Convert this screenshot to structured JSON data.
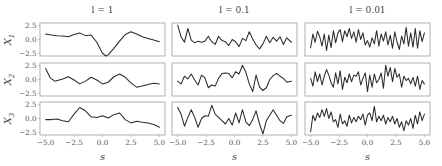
{
  "chart_data": {
    "type": "line",
    "title": "",
    "layout": {
      "rows": 3,
      "cols": 3,
      "grid": false,
      "legend": "none"
    },
    "column_titles": [
      "l = 1",
      "l = 0.1",
      "l = 0.01"
    ],
    "row_labels": [
      "X_1",
      "X_2",
      "X_3"
    ],
    "xlabel": "s",
    "xlim": [
      -5.0,
      5.0
    ],
    "ylim": [
      -3.0,
      3.0
    ],
    "xticks": [
      -5.0,
      -2.5,
      0.0,
      2.5,
      5.0
    ],
    "xtick_labels": [
      "−5.0",
      "−2.5",
      "0.0",
      "2.5",
      "5.0"
    ],
    "yticks": [
      2.5,
      0.0,
      -2.5
    ],
    "ytick_labels": [
      "2.5",
      "0.0",
      "−2.5"
    ],
    "panels": [
      {
        "row": 0,
        "col": 0,
        "name": "X1, l=1",
        "x": [
          -5.0,
          -4.5,
          -4.0,
          -3.5,
          -3.0,
          -2.5,
          -2.0,
          -1.5,
          -1.0,
          -0.5,
          0.0,
          0.3,
          0.5,
          1.0,
          1.5,
          2.0,
          2.5,
          3.0,
          3.5,
          4.0,
          4.5,
          5.0
        ],
        "y": [
          1.0,
          0.8,
          0.7,
          0.65,
          0.5,
          0.9,
          1.2,
          0.7,
          0.8,
          -0.5,
          -2.5,
          -3.0,
          -2.8,
          -1.6,
          -0.3,
          0.9,
          1.4,
          1.0,
          0.5,
          0.2,
          -0.1,
          -0.4
        ]
      },
      {
        "row": 1,
        "col": 0,
        "name": "X2, l=1",
        "x": [
          -5.0,
          -4.6,
          -4.2,
          -3.5,
          -3.0,
          -2.5,
          -2.0,
          -1.5,
          -1.0,
          -0.5,
          0.0,
          0.5,
          1.0,
          1.5,
          2.0,
          2.5,
          3.0,
          3.5,
          4.0,
          4.5,
          5.0
        ],
        "y": [
          2.0,
          0.3,
          -0.3,
          0.1,
          0.5,
          -0.1,
          -0.8,
          -0.3,
          0.4,
          -0.1,
          -0.8,
          -0.5,
          0.5,
          1.0,
          0.4,
          -0.6,
          -1.4,
          -1.2,
          -0.9,
          -0.7,
          -0.8
        ]
      },
      {
        "row": 2,
        "col": 0,
        "name": "X3, l=1",
        "x": [
          -5.0,
          -4.5,
          -4.0,
          -3.5,
          -3.0,
          -2.5,
          -2.0,
          -1.5,
          -1.0,
          -0.5,
          0.0,
          0.5,
          1.0,
          1.5,
          2.0,
          2.5,
          3.0,
          3.5,
          4.0,
          4.5,
          5.0
        ],
        "y": [
          -0.2,
          -0.2,
          -0.1,
          -0.4,
          -0.6,
          0.8,
          2.0,
          1.4,
          0.3,
          0.2,
          0.5,
          0.1,
          0.7,
          1.0,
          -0.2,
          -0.8,
          -0.5,
          -0.7,
          -0.8,
          -1.1,
          -1.6
        ]
      },
      {
        "row": 0,
        "col": 1,
        "name": "X1, l=0.1",
        "x": [
          -5.0,
          -4.7,
          -4.4,
          -4.1,
          -3.8,
          -3.5,
          -3.2,
          -2.9,
          -2.6,
          -2.3,
          -2.0,
          -1.7,
          -1.4,
          -1.1,
          -0.8,
          -0.5,
          -0.2,
          0.1,
          0.4,
          0.7,
          1.0,
          1.3,
          1.6,
          1.9,
          2.2,
          2.5,
          2.8,
          3.1,
          3.4,
          3.7,
          4.0,
          4.3,
          4.6,
          5.0
        ],
        "y": [
          2.6,
          0.5,
          -0.5,
          2.0,
          -0.1,
          -0.6,
          -0.3,
          -0.5,
          -0.3,
          0.6,
          -0.4,
          -0.9,
          0.6,
          -0.2,
          -0.4,
          -1.1,
          0.0,
          -0.4,
          -1.3,
          0.2,
          -0.2,
          1.4,
          0.1,
          -1.0,
          -1.7,
          -0.8,
          0.6,
          -0.6,
          0.4,
          -0.3,
          0.5,
          -0.9,
          0.3,
          -0.5
        ]
      },
      {
        "row": 1,
        "col": 1,
        "name": "X2, l=0.1",
        "x": [
          -5.0,
          -4.7,
          -4.4,
          -4.1,
          -3.8,
          -3.5,
          -3.2,
          -2.9,
          -2.6,
          -2.3,
          -2.0,
          -1.7,
          -1.4,
          -1.1,
          -0.8,
          -0.5,
          -0.2,
          0.1,
          0.4,
          0.7,
          1.0,
          1.3,
          1.6,
          1.9,
          2.2,
          2.5,
          2.8,
          3.1,
          3.4,
          3.7,
          4.0,
          4.3,
          4.6,
          5.0
        ],
        "y": [
          -0.3,
          -0.8,
          0.6,
          0.1,
          1.0,
          -0.1,
          -1.0,
          0.8,
          0.3,
          -1.5,
          -1.0,
          -1.2,
          0.2,
          1.1,
          1.2,
          1.1,
          0.3,
          1.4,
          1.0,
          2.6,
          1.3,
          -0.8,
          -2.2,
          0.8,
          -1.4,
          -2.0,
          -1.5,
          0.0,
          0.7,
          1.1,
          0.6,
          0.2,
          -0.5,
          -0.3
        ]
      },
      {
        "row": 2,
        "col": 1,
        "name": "X3, l=0.1",
        "x": [
          -5.0,
          -4.7,
          -4.4,
          -4.1,
          -3.8,
          -3.5,
          -3.2,
          -2.9,
          -2.6,
          -2.3,
          -2.0,
          -1.7,
          -1.4,
          -1.1,
          -0.8,
          -0.5,
          -0.2,
          0.1,
          0.4,
          0.7,
          1.0,
          1.3,
          1.6,
          1.9,
          2.2,
          2.5,
          2.8,
          3.1,
          3.4,
          3.7,
          4.0,
          4.3,
          4.6,
          5.0
        ],
        "y": [
          2.0,
          0.8,
          -1.4,
          0.2,
          1.6,
          0.2,
          -1.6,
          0.0,
          0.5,
          0.4,
          2.4,
          0.8,
          0.2,
          -0.4,
          -1.0,
          0.0,
          -1.2,
          1.0,
          -0.8,
          1.6,
          -0.6,
          -1.3,
          -0.2,
          1.4,
          -1.0,
          -2.8,
          -0.4,
          0.6,
          1.6,
          0.6,
          -0.4,
          -0.9,
          0.3,
          0.6
        ]
      },
      {
        "row": 0,
        "col": 2,
        "name": "X1, l=0.01",
        "x": [
          -5.0,
          -4.8,
          -4.6,
          -4.4,
          -4.2,
          -4.0,
          -3.8,
          -3.6,
          -3.4,
          -3.2,
          -3.0,
          -2.8,
          -2.6,
          -2.4,
          -2.2,
          -2.0,
          -1.8,
          -1.6,
          -1.4,
          -1.2,
          -1.0,
          -0.8,
          -0.6,
          -0.4,
          -0.2,
          0.0,
          0.2,
          0.4,
          0.6,
          0.8,
          1.0,
          1.2,
          1.4,
          1.6,
          1.8,
          2.0,
          2.2,
          2.4,
          2.6,
          2.8,
          3.0,
          3.2,
          3.4,
          3.6,
          3.8,
          4.0,
          4.2,
          4.4,
          4.6,
          4.8,
          5.0
        ],
        "y": [
          -1.5,
          1.0,
          -0.5,
          1.5,
          0.5,
          -1.2,
          1.0,
          -2.0,
          0.8,
          -1.5,
          1.6,
          -0.6,
          1.2,
          1.8,
          -0.4,
          1.6,
          0.5,
          2.0,
          0.2,
          1.4,
          -0.5,
          1.8,
          0.0,
          1.2,
          -1.0,
          -0.2,
          -1.4,
          0.3,
          -0.8,
          1.6,
          -1.2,
          1.0,
          -0.3,
          1.4,
          -1.0,
          0.8,
          -1.6,
          1.4,
          -0.5,
          -1.8,
          0.6,
          -0.8,
          2.2,
          -1.2,
          1.2,
          -1.4,
          2.0,
          -1.6,
          1.6,
          -0.4,
          1.2
        ]
      },
      {
        "row": 1,
        "col": 2,
        "name": "X2, l=0.01",
        "x": [
          -5.0,
          -4.8,
          -4.6,
          -4.4,
          -4.2,
          -4.0,
          -3.8,
          -3.6,
          -3.4,
          -3.2,
          -3.0,
          -2.8,
          -2.6,
          -2.4,
          -2.2,
          -2.0,
          -1.8,
          -1.6,
          -1.4,
          -1.2,
          -1.0,
          -0.8,
          -0.6,
          -0.4,
          -0.2,
          0.0,
          0.2,
          0.4,
          0.6,
          0.8,
          1.0,
          1.2,
          1.4,
          1.6,
          1.8,
          2.0,
          2.2,
          2.4,
          2.6,
          2.8,
          3.0,
          3.2,
          3.4,
          3.6,
          3.8,
          4.0,
          4.2,
          4.4,
          4.6,
          4.8,
          5.0
        ],
        "y": [
          0.2,
          -1.2,
          1.4,
          -0.4,
          1.0,
          -1.0,
          0.6,
          1.8,
          0.8,
          -0.6,
          -1.4,
          1.2,
          -0.8,
          1.6,
          -1.8,
          0.4,
          -0.6,
          1.0,
          -0.4,
          0.8,
          0.6,
          1.4,
          -1.0,
          0.2,
          1.2,
          -2.2,
          0.8,
          -1.4,
          1.0,
          -0.6,
          0.0,
          1.2,
          -1.6,
          2.6,
          0.6,
          2.2,
          -0.4,
          2.0,
          0.4,
          1.0,
          -1.4,
          0.6,
          -0.2,
          0.2,
          -0.8,
          0.4,
          -1.2,
          0.6,
          -1.8,
          -0.2,
          -0.8
        ]
      },
      {
        "row": 2,
        "col": 2,
        "name": "X3, l=0.01",
        "x": [
          -5.0,
          -4.8,
          -4.6,
          -4.4,
          -4.2,
          -4.0,
          -3.8,
          -3.6,
          -3.4,
          -3.2,
          -3.0,
          -2.8,
          -2.6,
          -2.4,
          -2.2,
          -2.0,
          -1.8,
          -1.6,
          -1.4,
          -1.2,
          -1.0,
          -0.8,
          -0.6,
          -0.4,
          -0.2,
          0.0,
          0.2,
          0.4,
          0.6,
          0.8,
          1.0,
          1.2,
          1.4,
          1.6,
          1.8,
          2.0,
          2.2,
          2.4,
          2.6,
          2.8,
          3.0,
          3.2,
          3.4,
          3.6,
          3.8,
          4.0,
          4.2,
          4.4,
          4.6,
          4.8,
          5.0
        ],
        "y": [
          -2.4,
          0.6,
          -0.4,
          1.0,
          0.2,
          1.6,
          0.4,
          1.8,
          0.0,
          1.2,
          -0.6,
          -0.2,
          -1.6,
          0.8,
          -1.0,
          -0.4,
          -1.4,
          0.6,
          -0.8,
          0.2,
          -0.6,
          0.4,
          -0.2,
          0.8,
          -1.2,
          0.6,
          1.0,
          -0.4,
          2.2,
          -0.6,
          0.4,
          -0.4,
          0.6,
          -1.0,
          0.2,
          -0.6,
          0.4,
          -1.0,
          0.0,
          -1.6,
          -0.6,
          -2.2,
          -0.4,
          -1.2,
          0.0,
          -1.8,
          0.6,
          -1.0,
          1.2,
          -0.4,
          0.8
        ]
      }
    ]
  },
  "figure": {
    "panel_cols_x": [
      40,
      172,
      305
    ],
    "panel_width": 125,
    "panel_rows_y": [
      23,
      63,
      102
    ],
    "panel_height": 33,
    "line_color": "#2b2b2b",
    "frame_color": "#a8a8a8"
  }
}
